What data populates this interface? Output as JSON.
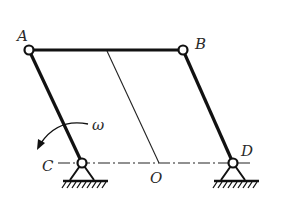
{
  "diagram": {
    "type": "four-bar linkage (parallelogram mechanism)",
    "joints": {
      "A": {
        "label": "A",
        "x": 29,
        "y": 50,
        "kind": "revolute"
      },
      "B": {
        "label": "B",
        "x": 183,
        "y": 50,
        "kind": "revolute"
      },
      "C": {
        "label": "C",
        "x": 82,
        "y": 163,
        "kind": "ground pivot"
      },
      "D": {
        "label": "D",
        "x": 233,
        "y": 163,
        "kind": "ground pivot"
      }
    },
    "point_O": {
      "label": "O",
      "x": 159,
      "y": 163
    },
    "links": [
      "AB",
      "AC",
      "BD"
    ],
    "ground_line": "C-D (dash-dot center line)",
    "angular_velocity": {
      "label": "ω",
      "direction": "counterclockwise about C"
    },
    "colors": {
      "ink": "#111111",
      "label": "#2a2a2a",
      "background": "#ffffff"
    }
  }
}
